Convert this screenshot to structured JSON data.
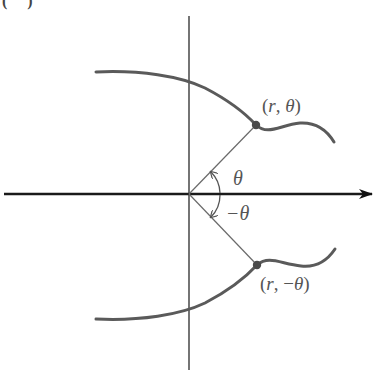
{
  "figure": {
    "panel_label_partial": "( )",
    "colors": {
      "axis": "#1a1a1a",
      "curve": "#5a5a5a",
      "ray": "#6a6a6a",
      "point": "#4a4a4a",
      "text": "#555555"
    },
    "axes": {
      "origin": [
        189,
        194
      ],
      "x_axis": {
        "from": [
          4,
          194
        ],
        "to": [
          373,
          194
        ],
        "arrowhead": true
      },
      "y_axis": {
        "from": [
          189,
          16
        ],
        "to": [
          189,
          370
        ],
        "arrowhead": false
      }
    },
    "points": [
      {
        "id": "upper",
        "label_parts": [
          "(",
          "r",
          ", ",
          "θ",
          ")"
        ],
        "label": "(r, θ)",
        "pos": [
          256,
          125
        ]
      },
      {
        "id": "lower",
        "label_parts": [
          "(",
          "r",
          ", −",
          "θ",
          ")"
        ],
        "label": "(r, −θ)",
        "pos": [
          257,
          265
        ]
      }
    ],
    "angles": [
      {
        "id": "theta",
        "label": "θ",
        "direction": "counterclockwise"
      },
      {
        "id": "neg-theta",
        "label": "−θ",
        "direction": "clockwise"
      }
    ],
    "curves": {
      "upper": "M 96 72 C 140 70, 180 76, 205 88 C 228 100, 245 113, 256 125 C 268 136, 280 125, 300 123 C 318 122, 328 132, 334 142",
      "lower": "M 96 319 C 140 321, 180 315, 205 303 C 228 291, 245 278, 257 265 C 269 255, 281 264, 301 266 C 319 268, 329 258, 335 249"
    }
  }
}
